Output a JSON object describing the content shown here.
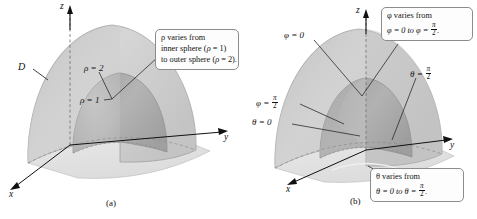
{
  "figure": {
    "type": "math-illustration",
    "background": "#ffffff",
    "ink": "#111111"
  },
  "panel_a": {
    "caption": "(a)",
    "axes": {
      "x": "x",
      "y": "y",
      "z": "z"
    },
    "labels": {
      "region": "D",
      "outer_sphere": "ρ = 2",
      "inner_sphere": "ρ = 1"
    },
    "callout": {
      "line1": "ρ varies from",
      "line2_pre": "inner sphere (",
      "line2_sym": "ρ",
      "line2_post": " = 1)",
      "line3_pre": "to outer sphere (",
      "line3_sym": "ρ",
      "line3_post": " = 2)."
    },
    "shading": {
      "outer_surface": "#c9c9c9",
      "outer_light": "#d8d8d8",
      "inner_surface": "#a8a8a8",
      "floor": "#e2e2e2"
    }
  },
  "panel_b": {
    "caption": "(b)",
    "axes": {
      "x": "x",
      "y": "y",
      "z": "z"
    },
    "labels": {
      "phi_zero": "φ = 0",
      "phi_half_pre": "φ = ",
      "theta_zero": "θ = 0",
      "theta_half_pre": "θ = ",
      "pi": "π",
      "two": "2"
    },
    "callout_phi": {
      "line1": "φ varies from",
      "line2_pre": "φ = 0 to φ = "
    },
    "callout_theta": {
      "line1": "θ varies from",
      "line2_pre": "θ = 0 to θ = "
    },
    "shading": {
      "outer_surface": "#c9c9c9",
      "outer_light": "#d8d8d8",
      "inner_surface": "#a8a8a8",
      "wedge": "#bdbdbd",
      "floor": "#e2e2e2"
    }
  }
}
